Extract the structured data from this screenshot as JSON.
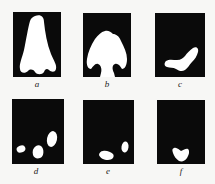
{
  "figure": {
    "panels": [
      {
        "id": "a",
        "label": "a",
        "shape": "nose-shaped blob widening downward with three lobes at bottom"
      },
      {
        "id": "b",
        "label": "b",
        "shape": "mushroom/arch-shaped blob with two hooked lobes at bottom corners"
      },
      {
        "id": "c",
        "label": "c",
        "shape": "boot-shaped (V) blob in lower center"
      },
      {
        "id": "d",
        "label": "d",
        "shape": "three separate small blobs near bottom"
      },
      {
        "id": "e",
        "label": "e",
        "shape": "two small blobs near bottom"
      },
      {
        "id": "f",
        "label": "f",
        "shape": "single small heart-shaped blob near bottom"
      }
    ],
    "colors": {
      "panel_background": "#0a0a0a",
      "blob": "#ffffff",
      "page_background": "#f7f7f5"
    }
  }
}
